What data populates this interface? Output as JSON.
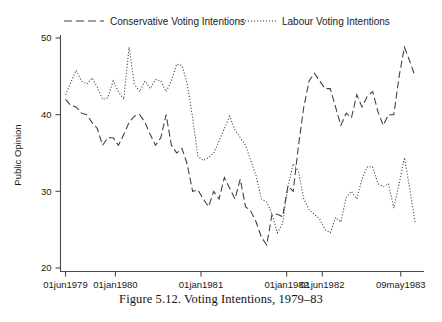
{
  "figure": {
    "caption": "Figure 5.12.  Voting Intentions, 1979–83"
  },
  "legend": {
    "items": [
      {
        "label": "Conservative Voting Intentions",
        "style": "long-dash"
      },
      {
        "label": "Labour Voting Intentions",
        "style": "dotted"
      }
    ]
  },
  "chart_data": {
    "type": "line",
    "title": "",
    "xlabel": "",
    "ylabel": "Public Opinion",
    "ylim": [
      18,
      51
    ],
    "yticks": [
      20,
      30,
      40,
      50
    ],
    "ytick_labels": [
      "20",
      "30",
      "40",
      "50"
    ],
    "xtick_positions": [
      0,
      7,
      19,
      31,
      36,
      47
    ],
    "xtick_labels": [
      "01jun1979",
      "01jan1980",
      "01jan1981",
      "01jan1982",
      "01jun1982",
      "09may1983"
    ],
    "xlim": [
      0,
      49
    ],
    "grid": false,
    "legend_position": "top",
    "series": [
      {
        "name": "Conservative Voting Intentions",
        "style": "long-dash",
        "values": [
          42.0,
          41.2,
          41.0,
          40.2,
          40.0,
          39.0,
          38.2,
          36.0,
          37.0,
          37.0,
          36.0,
          37.4,
          39.0,
          39.8,
          40.0,
          39.0,
          37.4,
          36.0,
          37.0,
          40.0,
          36.0,
          35.0,
          35.6,
          33.5,
          30.0,
          30.2,
          29.0,
          28.0,
          30.0,
          29.0,
          31.8,
          30.4,
          29.0,
          31.6,
          28.0,
          27.4,
          26.0,
          24.0,
          23.0,
          27.0,
          27.0,
          26.7,
          30.7,
          30.0,
          36.0,
          41.0,
          44.4,
          45.4,
          44.4,
          43.4,
          43.4,
          41.0,
          38.6,
          40.2,
          39.6,
          42.6,
          41.0,
          42.4,
          43.0,
          40.4,
          38.6,
          40.0,
          40.0,
          45.0,
          48.8,
          47.0,
          45.0
        ]
      },
      {
        "name": "Labour Voting Intentions",
        "style": "dotted",
        "values": [
          42.6,
          44.2,
          45.8,
          44.4,
          44.0,
          44.8,
          43.6,
          42.0,
          42.2,
          44.4,
          43.0,
          42.0,
          48.8,
          44.0,
          43.0,
          44.4,
          43.4,
          44.6,
          44.4,
          43.0,
          44.4,
          46.6,
          46.4,
          44.0,
          39.6,
          34.6,
          34.0,
          34.4,
          35.0,
          36.6,
          38.2,
          39.8,
          38.0,
          37.0,
          36.0,
          34.0,
          32.0,
          29.0,
          28.6,
          27.0,
          24.6,
          25.8,
          30.6,
          33.6,
          32.6,
          29.0,
          27.6,
          27.0,
          26.4,
          25.0,
          24.6,
          26.6,
          26.0,
          29.2,
          30.0,
          29.0,
          31.6,
          33.2,
          33.2,
          31.0,
          30.6,
          31.0,
          27.8,
          31.0,
          34.4,
          30.4,
          26.0
        ]
      }
    ]
  }
}
